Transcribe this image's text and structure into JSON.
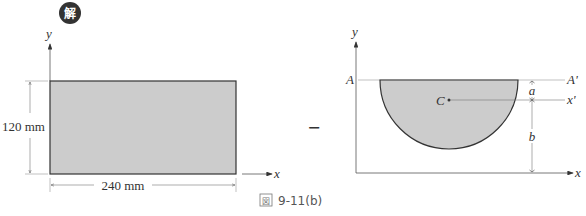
{
  "badge": {
    "label": "解",
    "color": "#333333"
  },
  "operator": "−",
  "caption": {
    "icon": "図",
    "label": "9-11(b)"
  },
  "left_figure": {
    "shape": "rectangle",
    "fill": "#cccccc",
    "axes": {
      "x": "x",
      "y": "y"
    },
    "dimensions": {
      "height": "120 mm",
      "width": "240 mm"
    }
  },
  "right_figure": {
    "shape": "semicircle",
    "fill": "#cccccc",
    "axes": {
      "x": "x",
      "y": "y"
    },
    "reference_line": {
      "left": "A",
      "right": "A'"
    },
    "centroid_label": "C",
    "centroid_axis": "x'",
    "dimensions": {
      "a": "a",
      "b": "b"
    }
  }
}
